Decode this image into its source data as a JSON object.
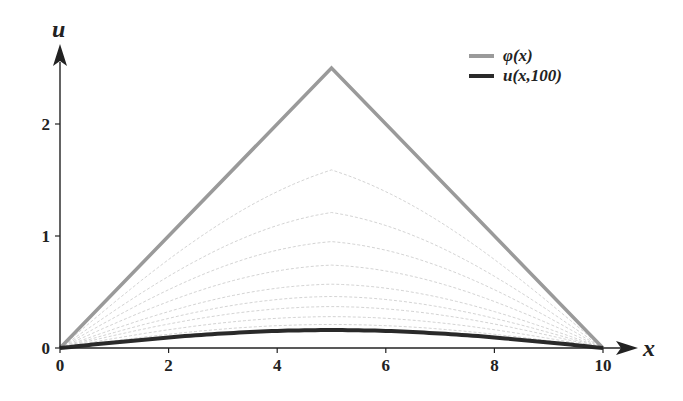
{
  "chart_data": {
    "type": "line",
    "title": "",
    "xlabel": "x",
    "ylabel": "u",
    "xlim": [
      0,
      10
    ],
    "ylim": [
      0,
      2.5
    ],
    "xticks": [
      0,
      2,
      4,
      6,
      8,
      10
    ],
    "yticks": [
      0,
      1,
      2
    ],
    "grid": false,
    "legend_position": "upper right",
    "series": [
      {
        "name": "φ(x)",
        "label": "φ(x)",
        "color": "#9a9a9a",
        "width": 3.5,
        "x": [
          0,
          5,
          10
        ],
        "y": [
          0,
          2.5,
          0
        ]
      },
      {
        "name": "intermediate-times",
        "label": "",
        "color": "#c8c8c8",
        "width": 0.8,
        "dashed": true,
        "peaks": [
          1.59,
          1.21,
          0.95,
          0.74,
          0.57,
          0.46,
          0.37,
          0.28,
          0.21
        ]
      },
      {
        "name": "u(x,100)",
        "label": "u(x,100)",
        "color": "#2a2a2a",
        "width": 4,
        "peak": 0.16,
        "shape": "sine-like arch from 0 to 10"
      }
    ]
  },
  "axes": {
    "x_label": "x",
    "y_label": "u",
    "x_ticks": [
      "0",
      "2",
      "4",
      "6",
      "8",
      "10"
    ],
    "y_ticks": [
      "0",
      "1",
      "2"
    ]
  },
  "legend": {
    "items": [
      {
        "label": "φ(x)",
        "color": "#9a9a9a"
      },
      {
        "label": "u(x,100)",
        "color": "#2a2a2a"
      }
    ]
  }
}
